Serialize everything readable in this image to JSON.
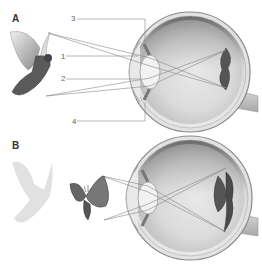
{
  "panels": [
    {
      "id": "A",
      "label": "A",
      "object": "dove",
      "image_on_retina": "inverted dove",
      "callouts": [
        {
          "number": "3"
        },
        {
          "number": "1"
        },
        {
          "number": "2"
        },
        {
          "number": "4"
        }
      ]
    },
    {
      "id": "B",
      "label": "B",
      "object": "butterfly",
      "faded_object": "dove silhouette",
      "image_on_retina": "inverted butterfly"
    }
  ],
  "colors": {
    "line": "#888888",
    "eye_shading": "#bbbbbb",
    "label": "#333333"
  }
}
